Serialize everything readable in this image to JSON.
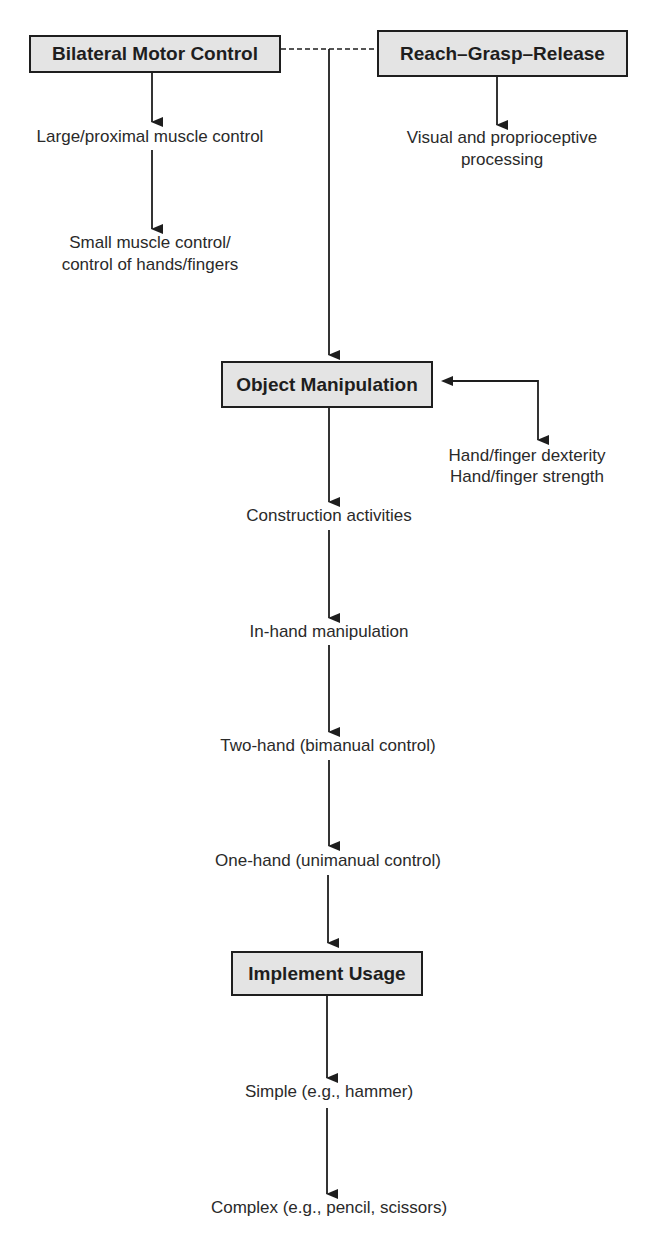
{
  "diagram": {
    "boxes": {
      "bilateral_motor_control": "Bilateral Motor Control",
      "reach_grasp_release": "Reach–Grasp–Release",
      "object_manipulation": "Object Manipulation",
      "implement_usage": "Implement Usage"
    },
    "bilateral_branch": [
      "Large/proximal muscle control",
      "Small muscle control/",
      "control of hands/fingers"
    ],
    "reach_branch": [
      "Visual and proprioceptive",
      "processing"
    ],
    "object_side": [
      "Hand/finger dexterity",
      "Hand/finger strength"
    ],
    "manipulation_sequence": [
      "Construction activities",
      "In-hand manipulation",
      "Two-hand (bimanual control)",
      "One-hand (unimanual control)"
    ],
    "implement_sequence": [
      "Simple (e.g., hammer)",
      "Complex (e.g., pencil, scissors)"
    ],
    "colors": {
      "box_fill": "#e4e4e4",
      "line": "#1e1e1e",
      "text": "#222222"
    }
  }
}
